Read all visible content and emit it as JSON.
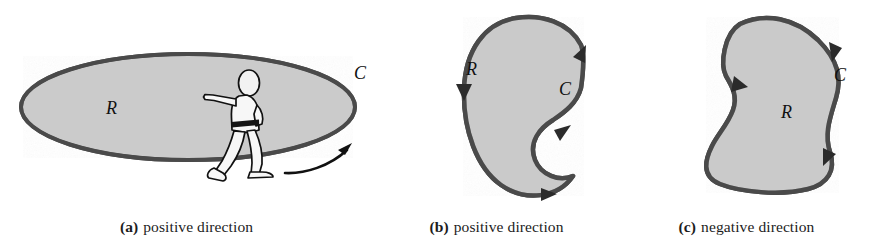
{
  "figure": {
    "background_color": "#ffffff",
    "region_fill_color": "#c8c8c8",
    "outline_color": "#4a4a4a",
    "label_color": "#111111",
    "arrow_color": "#111111"
  },
  "panels": [
    {
      "id": "a",
      "tag": "(a)",
      "caption": "positive direction",
      "shape": "ellipse",
      "region_label": "R",
      "curve_label": "C",
      "has_walking_person": true,
      "orientation": "counterclockwise",
      "arrow_count": 1
    },
    {
      "id": "b",
      "tag": "(b)",
      "caption": "positive direction",
      "shape": "crescent",
      "region_label": "R",
      "curve_label": "C",
      "has_walking_person": false,
      "orientation": "counterclockwise",
      "arrow_count": 4
    },
    {
      "id": "c",
      "tag": "(c)",
      "caption": "negative direction",
      "shape": "blob",
      "region_label": "R",
      "curve_label": "C",
      "has_walking_person": false,
      "orientation": "clockwise",
      "arrow_count": 3
    }
  ]
}
